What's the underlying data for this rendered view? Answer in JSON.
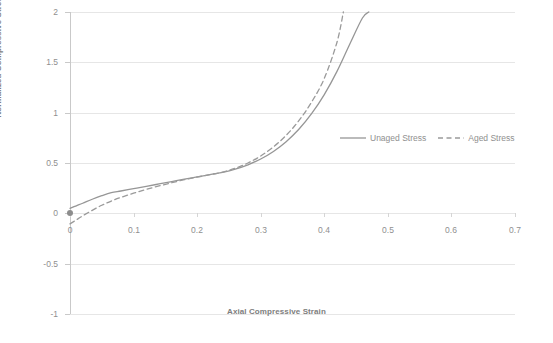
{
  "chart_data": {
    "type": "line",
    "title": "",
    "xlabel": "Axial Compressive Strain",
    "ylabel": "Normalized Compressive Stress",
    "xlim": [
      0,
      0.7
    ],
    "ylim": [
      -1,
      2
    ],
    "xticks": [
      "0",
      "0.1",
      "0.2",
      "0.3",
      "0.4",
      "0.5",
      "0.6",
      "0.7"
    ],
    "xtick_values": [
      0,
      0.1,
      0.2,
      0.3,
      0.4,
      0.5,
      0.6,
      0.7
    ],
    "yticks": [
      "-1",
      "-0.5",
      "0",
      "0.5",
      "1",
      "1.5",
      "2"
    ],
    "ytick_values": [
      -1,
      -0.5,
      0,
      0.5,
      1,
      1.5,
      2
    ],
    "grid": "horizontal",
    "legend_position": "center-right",
    "series": [
      {
        "name": "Unaged Stress",
        "style": "solid",
        "color": "#969696",
        "x": [
          0.0,
          0.01,
          0.02,
          0.035,
          0.05,
          0.065,
          0.08,
          0.1,
          0.12,
          0.14,
          0.16,
          0.18,
          0.2,
          0.22,
          0.24,
          0.26,
          0.28,
          0.3,
          0.32,
          0.34,
          0.36,
          0.38,
          0.4,
          0.42,
          0.44,
          0.46,
          0.47
        ],
        "y": [
          0.05,
          0.075,
          0.1,
          0.14,
          0.175,
          0.205,
          0.222,
          0.245,
          0.268,
          0.292,
          0.316,
          0.34,
          0.362,
          0.384,
          0.408,
          0.44,
          0.482,
          0.54,
          0.615,
          0.712,
          0.835,
          0.99,
          1.18,
          1.41,
          1.68,
          1.94,
          2.0
        ]
      },
      {
        "name": "Aged Stress",
        "style": "dashed",
        "color": "#9a9a9a",
        "x": [
          0.0,
          0.01,
          0.02,
          0.035,
          0.05,
          0.065,
          0.08,
          0.1,
          0.12,
          0.14,
          0.16,
          0.18,
          0.2,
          0.22,
          0.24,
          0.26,
          0.28,
          0.3,
          0.32,
          0.34,
          0.36,
          0.38,
          0.4,
          0.42,
          0.43
        ],
        "y": [
          -0.105,
          -0.065,
          -0.025,
          0.03,
          0.08,
          0.122,
          0.158,
          0.2,
          0.238,
          0.272,
          0.304,
          0.334,
          0.36,
          0.384,
          0.41,
          0.448,
          0.5,
          0.57,
          0.66,
          0.775,
          0.92,
          1.105,
          1.34,
          1.7,
          2.0
        ]
      }
    ],
    "crossover_point": {
      "x": 0.24,
      "y": 0.41
    }
  },
  "legend": {
    "entries": [
      {
        "label": "Unaged Stress",
        "style": "solid"
      },
      {
        "label": "Aged Stress",
        "style": "dashed"
      }
    ]
  }
}
